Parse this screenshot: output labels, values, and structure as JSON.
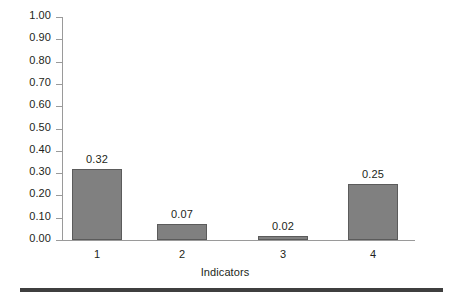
{
  "chart_data": {
    "type": "bar",
    "title": "",
    "xlabel": "Indicators",
    "ylabel": "",
    "categories": [
      "1",
      "2",
      "3",
      "4"
    ],
    "values": [
      0.32,
      0.07,
      0.02,
      0.25
    ],
    "value_labels": [
      "0.32",
      "0.07",
      "0.02",
      "0.25"
    ],
    "ylim": [
      0.0,
      1.0
    ],
    "ytick_labels": [
      "1.00",
      "0.90",
      "0.80",
      "0.70",
      "0.60",
      "0.50",
      "0.40",
      "0.30",
      "0.20",
      "0.10",
      "0.00"
    ],
    "ytick_values": [
      1.0,
      0.9,
      0.8,
      0.7,
      0.6,
      0.5,
      0.4,
      0.3,
      0.2,
      0.1,
      0.0
    ],
    "grid": false,
    "legend": false,
    "bar_color": "#808080",
    "bar_border_color": "#5b5b5b",
    "axis_color": "#9a9a9a",
    "text_color": "#231f20",
    "rule_color": "#3f3f3f"
  }
}
